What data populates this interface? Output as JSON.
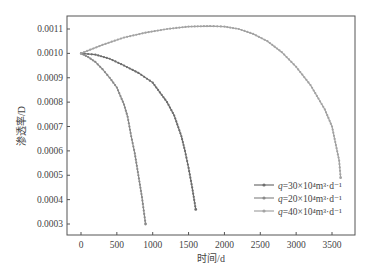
{
  "chart_data": {
    "type": "line",
    "title": "",
    "xlabel": "时间/d",
    "ylabel": "渗透率/D",
    "xlim": [
      -100,
      3800
    ],
    "ylim": [
      0.00025,
      0.00115
    ],
    "xticks": [
      0,
      500,
      1000,
      1500,
      2000,
      2500,
      3000,
      3500
    ],
    "xtick_labels": [
      "0",
      "500",
      "1000",
      "1500",
      "2000",
      "2500",
      "3000",
      "3500"
    ],
    "yticks": [
      0.0003,
      0.0004,
      0.0005,
      0.0006,
      0.0007,
      0.0008,
      0.0009,
      0.001,
      0.0011
    ],
    "ytick_labels": [
      "0.0003",
      "0.0004",
      "0.0005",
      "0.0006",
      "0.0007",
      "0.0008",
      "0.0009",
      "0.0010",
      "0.0011"
    ],
    "grid": false,
    "legend_position": "lower right",
    "series": [
      {
        "name": "q=30×10⁴m³·d⁻¹",
        "legend_q": "q",
        "legend_rest": "=30×10⁴m³·d⁻¹",
        "color": "#6e6e6e",
        "x": [
          0,
          200,
          400,
          600,
          800,
          1000,
          1200,
          1300,
          1400,
          1450,
          1500,
          1550,
          1600
        ],
        "y": [
          0.001,
          0.000995,
          0.000978,
          0.00095,
          0.00092,
          0.00088,
          0.0008,
          0.000745,
          0.00066,
          0.0006,
          0.00053,
          0.00045,
          0.00036
        ]
      },
      {
        "name": "q=20×10⁴m³·d⁻¹",
        "legend_q": "q",
        "legend_rest": "=20×10⁴m³·d⁻¹",
        "color": "#8a8a8a",
        "x": [
          0,
          100,
          200,
          300,
          400,
          500,
          600,
          650,
          700,
          750,
          800,
          850,
          900
        ],
        "y": [
          0.001,
          0.000985,
          0.000965,
          0.000935,
          0.0009,
          0.00086,
          0.00079,
          0.00074,
          0.00066,
          0.00059,
          0.0005,
          0.00041,
          0.0003
        ]
      },
      {
        "name": "q=40×10⁴m³·d⁻¹",
        "legend_q": "q",
        "legend_rest": "=40×10⁴m³·d⁻¹",
        "color": "#a3a3a3",
        "x": [
          0,
          300,
          600,
          900,
          1200,
          1500,
          1800,
          2000,
          2200,
          2400,
          2600,
          2800,
          3000,
          3200,
          3400,
          3500,
          3600,
          3620
        ],
        "y": [
          0.001,
          0.001035,
          0.001065,
          0.001085,
          0.0011,
          0.00111,
          0.001112,
          0.00111,
          0.0011,
          0.00108,
          0.00105,
          0.001005,
          0.000945,
          0.00087,
          0.00077,
          0.0007,
          0.00056,
          0.00049
        ]
      }
    ]
  }
}
